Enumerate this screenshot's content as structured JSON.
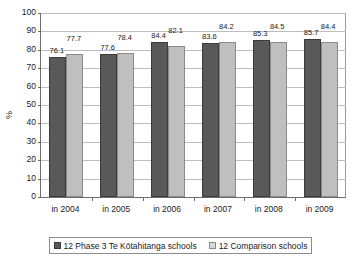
{
  "chart_data": {
    "type": "bar",
    "title": "",
    "xlabel": "",
    "ylabel": "%",
    "ylim": [
      0,
      100
    ],
    "ytick_step": 10,
    "yticks": [
      "100",
      "90",
      "80",
      "70",
      "60",
      "50",
      "40",
      "30",
      "20",
      "10",
      "0"
    ],
    "grid": true,
    "legend_position": "bottom",
    "categories": [
      "in 2004",
      "in 2005",
      "in 2006",
      "in 2007",
      "in 2008",
      "in 2009"
    ],
    "series": [
      {
        "name": "12 Phase 3 Te Kōtahitanga schools",
        "color": "#595959",
        "values": [
          76.1,
          77.6,
          84.4,
          83.6,
          85.3,
          85.7
        ],
        "labels": [
          "76.1",
          "77.6",
          "84.4",
          "83.6",
          "85.3",
          "85.7"
        ]
      },
      {
        "name": "12 Comparison schools",
        "color": "#bfbfbf",
        "values": [
          77.7,
          78.4,
          82.1,
          84.2,
          84.5,
          84.4
        ],
        "labels": [
          "77.7",
          "78.4",
          "82.1",
          "84.2",
          "84.5",
          "84.4"
        ]
      }
    ]
  },
  "legend": {
    "entries": [
      {
        "label": "12 Phase 3 Te Kōtahitanga schools",
        "swatch": "dark-gray-swatch"
      },
      {
        "label": "12 Comparison schools",
        "swatch": "light-gray-swatch"
      }
    ]
  }
}
